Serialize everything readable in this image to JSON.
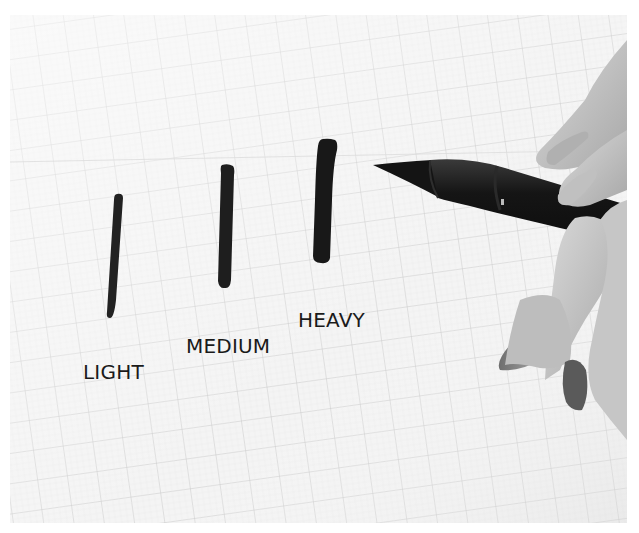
{
  "scene": {
    "description": "Grayscale photo of brush pen strokes of varying pressure on graph paper, with a hand holding a brush pen",
    "paper": {
      "background": "#f3f3f3",
      "grid_color": "#c9c9c9",
      "grid_spacing_px": 30,
      "grid_rotation_deg": -8
    },
    "ink_color": "#1c1c1c"
  },
  "strokes": [
    {
      "name": "light",
      "label": "LIGHT"
    },
    {
      "name": "medium",
      "label": "MEDIUM"
    },
    {
      "name": "heavy",
      "label": "HEAVY"
    }
  ],
  "labels": {
    "light": "LIGHT",
    "medium": "MEDIUM",
    "heavy": "HEAVY"
  }
}
